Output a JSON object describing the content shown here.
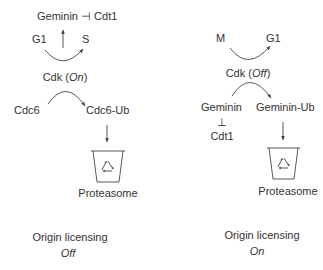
{
  "left_panel": {
    "inhibition": {
      "source": "Geminin",
      "symbol": "⊣",
      "target": "Cdt1"
    },
    "phase_from": "G1",
    "phase_to": "S",
    "cdk_label": "Cdk",
    "cdk_state": "On",
    "substrate": "Cdc6",
    "product": "Cdc6-Ub",
    "degradation": "Proteasome",
    "outcome_label": "Origin licensing",
    "outcome_state": "Off"
  },
  "right_panel": {
    "phase_from": "M",
    "phase_to": "G1",
    "cdk_label": "Cdk",
    "cdk_state": "Off",
    "substrate": "Geminin",
    "product": "Geminin-Ub",
    "inhibition_symbol": "⊥",
    "inhibited": "Cdt1",
    "degradation": "Proteasome",
    "outcome_label": "Origin licensing",
    "outcome_state": "On"
  },
  "colors": {
    "ink": "#333333",
    "line": "#444444"
  }
}
